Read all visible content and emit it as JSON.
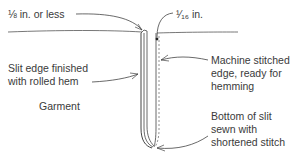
{
  "diagram": {
    "labels": {
      "eighth_inch": "⅛ in. or less",
      "sixteenth_inch": "¹⁄₁₆ in.",
      "slit_edge_line1": "Slit edge finished",
      "slit_edge_line2": "with rolled hem",
      "machine_line1": "Machine stitched",
      "machine_line2": "edge, ready for",
      "machine_line3": "hemming",
      "garment": "Garment",
      "bottom_line1": "Bottom of slit",
      "bottom_line2": "sewn with",
      "bottom_line3": "shortened stitch"
    },
    "colors": {
      "ink": "#3a3a3a",
      "line": "#444444",
      "background": "#ffffff"
    }
  }
}
